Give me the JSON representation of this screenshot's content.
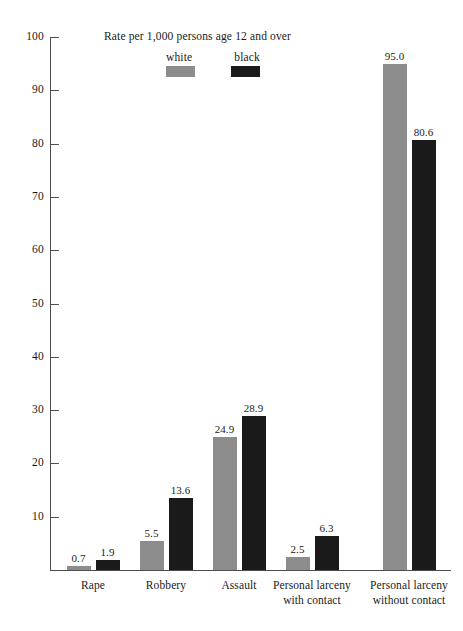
{
  "chart_data": {
    "type": "bar",
    "title": "Rate per 1,000 persons age 12 and over",
    "xlabel": "",
    "ylabel": "",
    "ylim": [
      0,
      100
    ],
    "yticks": [
      0,
      10,
      20,
      30,
      40,
      50,
      60,
      70,
      80,
      90,
      100
    ],
    "ytick_labels": [
      "",
      "10",
      "20",
      "30",
      "40",
      "50",
      "60",
      "70",
      "80",
      "90",
      "100"
    ],
    "grid": false,
    "legend_position": "top-center",
    "categories": [
      "Rape",
      "Robbery",
      "Assault",
      "Personal larceny\nwith contact",
      "Personal larceny\nwithout contact"
    ],
    "category_lines": [
      [
        "Rape"
      ],
      [
        "Robbery"
      ],
      [
        "Assault"
      ],
      [
        "Personal larceny",
        "with contact"
      ],
      [
        "Personal larceny",
        "without contact"
      ]
    ],
    "series": [
      {
        "name": "white",
        "color": "#8c8c8c",
        "values": [
          0.7,
          5.5,
          24.9,
          2.5,
          95.0
        ],
        "labels": [
          "0.7",
          "5.5",
          "24.9",
          "2.5",
          "95.0"
        ]
      },
      {
        "name": "black",
        "color": "#1a1a1a",
        "values": [
          1.9,
          13.6,
          28.9,
          6.3,
          80.6
        ],
        "labels": [
          "1.9",
          "13.6",
          "28.9",
          "6.3",
          "80.6"
        ]
      }
    ]
  },
  "legend": {
    "items": [
      {
        "label": "white",
        "color": "#8c8c8c"
      },
      {
        "label": "black",
        "color": "#1a1a1a"
      }
    ]
  },
  "axis": {
    "y_labels": [
      "100",
      "90",
      "80",
      "70",
      "60",
      "50",
      "40",
      "30",
      "20",
      "10"
    ]
  }
}
